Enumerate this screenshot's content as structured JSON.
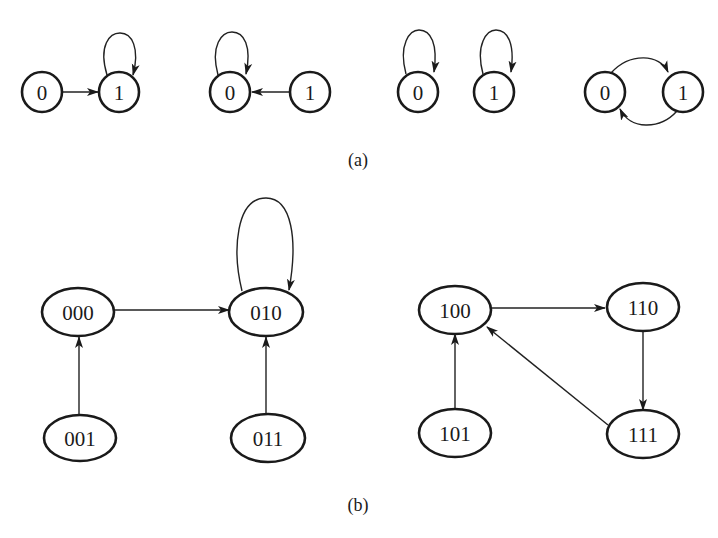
{
  "figure": {
    "part_a": {
      "caption": "(a)",
      "graphs": [
        {
          "id": "a1",
          "nodes": [
            {
              "id": "a1n0",
              "label": "0",
              "cx": 42,
              "cy": 92
            },
            {
              "id": "a1n1",
              "label": "1",
              "cx": 119,
              "cy": 92
            }
          ],
          "edges": [
            {
              "from": "0",
              "to": "1",
              "kind": "straight"
            },
            {
              "from": "1",
              "to": "1",
              "kind": "self-loop"
            }
          ]
        },
        {
          "id": "a2",
          "nodes": [
            {
              "id": "a2n0",
              "label": "0",
              "cx": 230,
              "cy": 92
            },
            {
              "id": "a2n1",
              "label": "1",
              "cx": 310,
              "cy": 92
            }
          ],
          "edges": [
            {
              "from": "1",
              "to": "0",
              "kind": "straight"
            },
            {
              "from": "0",
              "to": "0",
              "kind": "self-loop"
            }
          ]
        },
        {
          "id": "a3",
          "nodes": [
            {
              "id": "a3n0",
              "label": "0",
              "cx": 418,
              "cy": 92
            },
            {
              "id": "a3n1",
              "label": "1",
              "cx": 494,
              "cy": 92
            }
          ],
          "edges": [
            {
              "from": "0",
              "to": "0",
              "kind": "self-loop"
            },
            {
              "from": "1",
              "to": "1",
              "kind": "self-loop"
            }
          ]
        },
        {
          "id": "a4",
          "nodes": [
            {
              "id": "a4n0",
              "label": "0",
              "cx": 605,
              "cy": 92
            },
            {
              "id": "a4n1",
              "label": "1",
              "cx": 683,
              "cy": 92
            }
          ],
          "edges": [
            {
              "from": "0",
              "to": "1",
              "kind": "arc-upper"
            },
            {
              "from": "1",
              "to": "0",
              "kind": "arc-lower"
            }
          ]
        }
      ]
    },
    "part_b": {
      "caption": "(b)",
      "nodes": [
        {
          "id": "000",
          "label": "000",
          "cx": 78,
          "cy": 312
        },
        {
          "id": "010",
          "label": "010",
          "cx": 266,
          "cy": 312
        },
        {
          "id": "001",
          "label": "001",
          "cx": 80,
          "cy": 438
        },
        {
          "id": "011",
          "label": "011",
          "cx": 268,
          "cy": 438
        },
        {
          "id": "100",
          "label": "100",
          "cx": 455,
          "cy": 310
        },
        {
          "id": "110",
          "label": "110",
          "cx": 643,
          "cy": 307
        },
        {
          "id": "101",
          "label": "101",
          "cx": 455,
          "cy": 433
        },
        {
          "id": "111",
          "label": "111",
          "cx": 643,
          "cy": 434
        }
      ],
      "edges": [
        {
          "from": "000",
          "to": "010"
        },
        {
          "from": "001",
          "to": "000"
        },
        {
          "from": "011",
          "to": "010"
        },
        {
          "from": "010",
          "to": "010",
          "kind": "self-loop"
        },
        {
          "from": "101",
          "to": "100"
        },
        {
          "from": "100",
          "to": "110"
        },
        {
          "from": "110",
          "to": "111"
        },
        {
          "from": "111",
          "to": "100"
        }
      ]
    },
    "colors": {
      "stroke": "#1a1a1a",
      "background": "#ffffff"
    }
  }
}
